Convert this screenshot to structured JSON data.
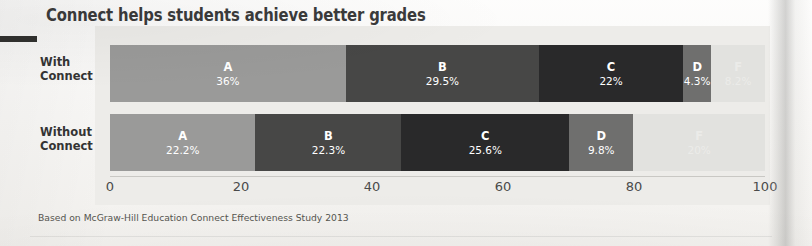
{
  "title": "Connect helps students achieve better grades",
  "footnote": "Based on McGraw-Hill Education Connect Effectiveness Study 2013",
  "row_labels": {
    "with": "With\nConnect",
    "with_line1": "With",
    "with_line2": "Connect",
    "without_line1": "Without",
    "without_line2": "Connect"
  },
  "colors": {
    "panel_background": "#edece9",
    "page_background": "#faf9f7",
    "title_color": "#3b3b3b",
    "grade_a": "#9a9a99",
    "grade_b": "#474746",
    "grade_c": "#29292a",
    "grade_d": "#6f6f6e",
    "grade_f": "#e2e2df",
    "axis_text": "#4a4a4a",
    "left_rule": "#31312f"
  },
  "chart_data": {
    "type": "bar",
    "subtype": "horizontal-stacked-100",
    "title": "Connect helps students achieve better grades",
    "xlabel": "",
    "ylabel": "",
    "xlim": [
      0,
      100
    ],
    "grid": false,
    "legend": "none",
    "legend_position": "in-bar-labels",
    "categories": [
      "With Connect",
      "Without Connect"
    ],
    "x_ticks": [
      0,
      20,
      40,
      60,
      80,
      100
    ],
    "x_tick_labels": [
      "0",
      "20",
      "40",
      "60",
      "80",
      "100"
    ],
    "series": [
      {
        "name": "A",
        "values": [
          36,
          22.2
        ],
        "color": "#9a9a99",
        "text_on": "dark"
      },
      {
        "name": "B",
        "values": [
          29.5,
          22.3
        ],
        "color": "#474746",
        "text_on": "dark"
      },
      {
        "name": "C",
        "values": [
          22,
          25.6
        ],
        "color": "#29292a",
        "text_on": "dark"
      },
      {
        "name": "D",
        "values": [
          4.3,
          9.8
        ],
        "color": "#6f6f6e",
        "text_on": "dark"
      },
      {
        "name": "F",
        "values": [
          8.2,
          20.1
        ],
        "color": "#e2e2df",
        "text_on": "light"
      }
    ],
    "rows": [
      {
        "label_line1": "With",
        "label_line2": "Connect",
        "segments": [
          {
            "grade": "A",
            "value": 36,
            "value_label": "36%",
            "color": "#9a9a99",
            "text_on": "dark"
          },
          {
            "grade": "B",
            "value": 29.5,
            "value_label": "29.5%",
            "color": "#474746",
            "text_on": "dark"
          },
          {
            "grade": "C",
            "value": 22,
            "value_label": "22%",
            "color": "#29292a",
            "text_on": "dark"
          },
          {
            "grade": "D",
            "value": 4.3,
            "value_label": "4.3%",
            "color": "#6f6f6e",
            "text_on": "dark"
          },
          {
            "grade": "F",
            "value": 8.2,
            "value_label": "8.2%",
            "color": "#e2e2df",
            "text_on": "light"
          }
        ]
      },
      {
        "label_line1": "Without",
        "label_line2": "Connect",
        "segments": [
          {
            "grade": "A",
            "value": 22.2,
            "value_label": "22.2%",
            "color": "#9a9a99",
            "text_on": "dark"
          },
          {
            "grade": "B",
            "value": 22.3,
            "value_label": "22.3%",
            "color": "#474746",
            "text_on": "dark"
          },
          {
            "grade": "C",
            "value": 25.6,
            "value_label": "25.6%",
            "color": "#29292a",
            "text_on": "dark"
          },
          {
            "grade": "D",
            "value": 9.8,
            "value_label": "9.8%",
            "color": "#6f6f6e",
            "text_on": "dark"
          },
          {
            "grade": "F",
            "value": 20.1,
            "value_label": "20%",
            "color": "#e2e2df",
            "text_on": "light"
          }
        ]
      }
    ]
  }
}
